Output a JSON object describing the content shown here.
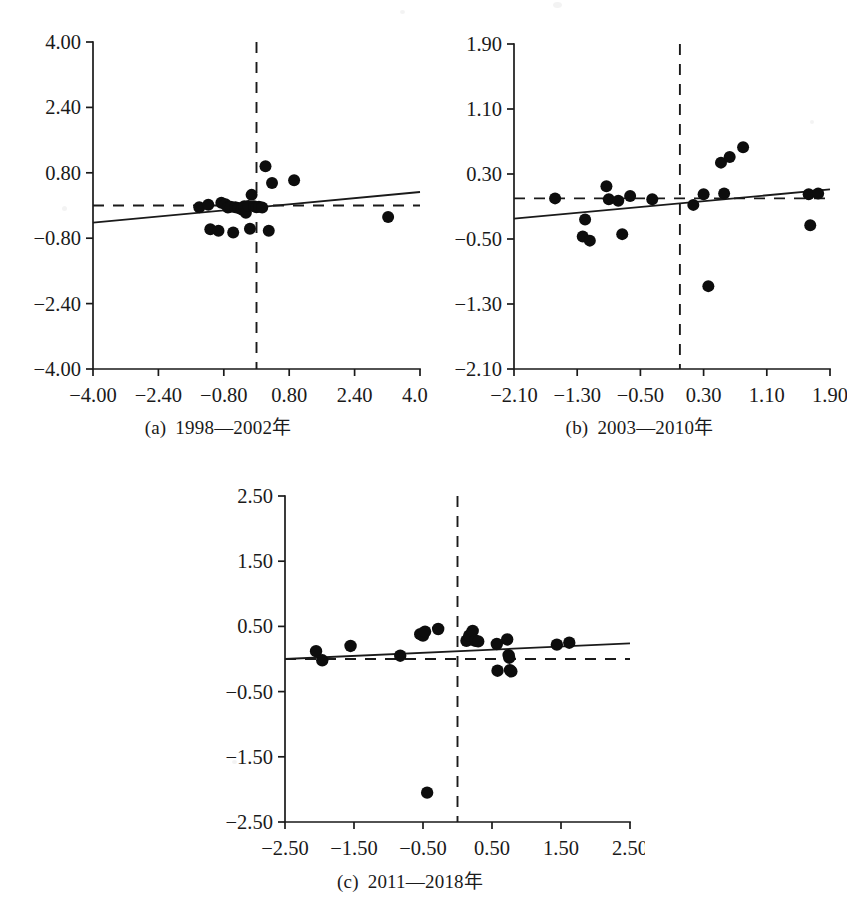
{
  "figure": {
    "background_color": "#ffffff",
    "ink_color": "#1a1a1a",
    "point_color": "#0d0d0d"
  },
  "panels": [
    {
      "id": "a",
      "caption_tag": "(a)",
      "caption_text": "1998—2002年"
    },
    {
      "id": "b",
      "caption_tag": "(b)",
      "caption_text": "2003—2010年"
    },
    {
      "id": "c",
      "caption_tag": "(c)",
      "caption_text": "2011—2018年"
    }
  ],
  "chart_data": [
    {
      "type": "scatter",
      "panel": "a",
      "title": "(a) 1998—2002年",
      "xlabel": "",
      "ylabel": "",
      "xlim": [
        -4.0,
        4.0
      ],
      "ylim": [
        -4.0,
        4.0
      ],
      "xticks": [
        -4.0,
        -2.4,
        -0.8,
        0.8,
        2.4,
        4.0
      ],
      "yticks": [
        -4.0,
        -2.4,
        -0.8,
        0.8,
        2.4,
        4.0
      ],
      "xtick_labels": [
        "-4.00",
        "-2.40",
        "-0.80",
        "0.80",
        "2.40",
        "4.00"
      ],
      "ytick_labels": [
        "-4.00",
        "-2.40",
        "-0.80",
        "0.80",
        "2.40",
        "4.00"
      ],
      "grid": false,
      "legend": null,
      "reference_lines": [
        {
          "orientation": "vertical",
          "value": 0.0,
          "style": "dashed"
        },
        {
          "orientation": "horizontal",
          "value": 0.0,
          "style": "dashed"
        }
      ],
      "fit_line": {
        "style": "solid",
        "x_start": -4.0,
        "y_start": -0.42,
        "x_end": 4.0,
        "y_end": 0.33
      },
      "points": [
        [
          -1.4,
          -0.04
        ],
        [
          -1.18,
          0.02
        ],
        [
          -1.13,
          -0.58
        ],
        [
          -0.93,
          -0.62
        ],
        [
          -0.86,
          0.07
        ],
        [
          -0.76,
          0.03
        ],
        [
          -0.7,
          -0.05
        ],
        [
          -0.63,
          -0.03
        ],
        [
          -0.57,
          -0.66
        ],
        [
          -0.52,
          -0.04
        ],
        [
          -0.44,
          -0.06
        ],
        [
          -0.36,
          -0.1
        ],
        [
          -0.3,
          -0.02
        ],
        [
          -0.26,
          -0.18
        ],
        [
          -0.2,
          -0.01
        ],
        [
          -0.16,
          -0.57
        ],
        [
          -0.12,
          0.26
        ],
        [
          -0.06,
          -0.02
        ],
        [
          0.0,
          -0.04
        ],
        [
          0.06,
          -0.03
        ],
        [
          0.14,
          -0.05
        ],
        [
          0.22,
          0.96
        ],
        [
          0.3,
          -0.62
        ],
        [
          0.38,
          0.55
        ],
        [
          0.92,
          0.62
        ],
        [
          3.22,
          -0.28
        ]
      ]
    },
    {
      "type": "scatter",
      "panel": "b",
      "title": "(b) 2003—2010年",
      "xlabel": "",
      "ylabel": "",
      "xlim": [
        -2.1,
        1.9
      ],
      "ylim": [
        -2.1,
        1.9
      ],
      "xticks": [
        -2.1,
        -1.3,
        -0.5,
        0.3,
        1.1,
        1.9
      ],
      "yticks": [
        -2.1,
        -1.3,
        -0.5,
        0.3,
        1.1,
        1.9
      ],
      "xtick_labels": [
        "-2.10",
        "-1.30",
        "-0.50",
        "0.30",
        "1.10",
        "1.90"
      ],
      "ytick_labels": [
        "-2.10",
        "-1.30",
        "-0.50",
        "0.30",
        "1.10",
        "1.90"
      ],
      "grid": false,
      "legend": null,
      "reference_lines": [
        {
          "orientation": "vertical",
          "value": 0.0,
          "style": "dashed"
        },
        {
          "orientation": "horizontal",
          "value": 0.0,
          "style": "dashed"
        }
      ],
      "fit_line": {
        "style": "solid",
        "x_start": -2.1,
        "y_start": -0.25,
        "x_end": 1.9,
        "y_end": 0.11
      },
      "points": [
        [
          -1.58,
          0.0
        ],
        [
          -1.23,
          -0.47
        ],
        [
          -1.2,
          -0.26
        ],
        [
          -1.14,
          -0.52
        ],
        [
          -0.93,
          0.15
        ],
        [
          -0.9,
          -0.01
        ],
        [
          -0.78,
          -0.03
        ],
        [
          -0.73,
          -0.44
        ],
        [
          -0.63,
          0.03
        ],
        [
          -0.35,
          -0.01
        ],
        [
          0.17,
          -0.08
        ],
        [
          0.3,
          0.05
        ],
        [
          0.36,
          -1.08
        ],
        [
          0.52,
          0.44
        ],
        [
          0.56,
          0.06
        ],
        [
          0.63,
          0.51
        ],
        [
          0.8,
          0.63
        ],
        [
          1.63,
          0.05
        ],
        [
          1.65,
          -0.33
        ],
        [
          1.75,
          0.06
        ]
      ]
    },
    {
      "type": "scatter",
      "panel": "c",
      "title": "(c) 2011—2018年",
      "xlabel": "",
      "ylabel": "",
      "xlim": [
        -2.5,
        2.5
      ],
      "ylim": [
        -2.5,
        2.5
      ],
      "xticks": [
        -2.5,
        -1.5,
        -0.5,
        0.5,
        1.5,
        2.5
      ],
      "yticks": [
        -2.5,
        -1.5,
        -0.5,
        0.5,
        1.5,
        2.5
      ],
      "xtick_labels": [
        "-2.50",
        "-1.50",
        "-0.50",
        "0.50",
        "1.50",
        "2.50"
      ],
      "ytick_labels": [
        "-2.50",
        "-1.50",
        "-0.50",
        "0.50",
        "1.50",
        "2.50"
      ],
      "grid": false,
      "legend": null,
      "reference_lines": [
        {
          "orientation": "vertical",
          "value": 0.0,
          "style": "dashed"
        },
        {
          "orientation": "horizontal",
          "value": 0.0,
          "style": "dashed"
        }
      ],
      "fit_line": {
        "style": "solid",
        "x_start": -2.5,
        "y_start": 0.0,
        "x_end": 2.5,
        "y_end": 0.24
      },
      "points": [
        [
          -2.05,
          0.12
        ],
        [
          -1.96,
          -0.02
        ],
        [
          -1.55,
          0.2
        ],
        [
          -0.83,
          0.05
        ],
        [
          -0.54,
          0.38
        ],
        [
          -0.5,
          0.36
        ],
        [
          -0.47,
          0.42
        ],
        [
          -0.44,
          -2.05
        ],
        [
          -0.28,
          0.46
        ],
        [
          0.13,
          0.28
        ],
        [
          0.17,
          0.36
        ],
        [
          0.22,
          0.43
        ],
        [
          0.26,
          0.28
        ],
        [
          0.3,
          0.27
        ],
        [
          0.57,
          0.23
        ],
        [
          0.58,
          -0.18
        ],
        [
          0.72,
          0.3
        ],
        [
          0.74,
          0.06
        ],
        [
          0.75,
          0.02
        ],
        [
          0.76,
          -0.17
        ],
        [
          0.78,
          -0.19
        ],
        [
          1.44,
          0.22
        ],
        [
          1.62,
          0.25
        ]
      ]
    }
  ]
}
